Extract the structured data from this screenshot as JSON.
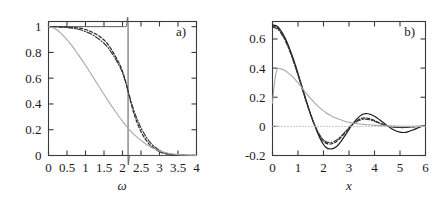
{
  "figure": {
    "background": "#ffffff",
    "foreground": "#1a1a1a",
    "panels": [
      "a)",
      "b)"
    ]
  },
  "chart_data": [
    {
      "type": "line",
      "panel_label": "a)",
      "title": "",
      "xlabel": "ω",
      "ylabel": "",
      "xlim": [
        0,
        4
      ],
      "ylim": [
        0,
        1.04
      ],
      "grid": false,
      "legend": "none",
      "xticks": [
        0,
        0.5,
        1,
        1.5,
        2,
        2.5,
        3,
        3.5,
        4
      ],
      "xticklabels": [
        "0",
        "0.5",
        "1",
        "1.5",
        "2",
        "2.5",
        "3",
        "3.5",
        "4"
      ],
      "yticks": [
        0,
        0.2,
        0.4,
        0.6,
        0.8,
        1
      ],
      "yticklabels": [
        "0",
        "0.2",
        "0.4",
        "0.6",
        "0.8",
        "1"
      ],
      "series": [
        {
          "name": "step-cutoff",
          "style": "solid",
          "color": "#555555",
          "width": 1.0,
          "x": [
            0,
            0.2,
            0.4,
            0.6,
            0.8,
            1.0,
            1.2,
            1.4,
            1.6,
            1.8,
            2.0,
            2.1,
            2.15,
            2.15,
            2.2,
            2.4,
            2.6,
            2.8,
            3.0,
            3.2,
            3.5,
            4.0
          ],
          "y": [
            1,
            1,
            1,
            1,
            1,
            1,
            1,
            1,
            1,
            1,
            1,
            1,
            1,
            0,
            0,
            0,
            0,
            0,
            0,
            0,
            0,
            0
          ]
        },
        {
          "name": "dashed-sigmoid",
          "style": "dashed",
          "color": "#262626",
          "width": 1.2,
          "x": [
            0,
            0.2,
            0.4,
            0.6,
            0.8,
            1.0,
            1.2,
            1.4,
            1.6,
            1.8,
            1.95,
            2.05,
            2.15,
            2.25,
            2.35,
            2.5,
            2.65,
            2.8,
            3.0,
            3.2,
            3.5,
            4.0
          ],
          "y": [
            1.0,
            1.0,
            0.998,
            0.995,
            0.99,
            0.978,
            0.955,
            0.92,
            0.865,
            0.775,
            0.69,
            0.61,
            0.5,
            0.385,
            0.29,
            0.185,
            0.115,
            0.068,
            0.03,
            0.012,
            0.003,
            0.0
          ]
        },
        {
          "name": "dot-dashed-sigmoid",
          "style": "dashdot",
          "color": "#3a3a3a",
          "width": 1.2,
          "x": [
            0,
            0.2,
            0.4,
            0.6,
            0.8,
            1.0,
            1.2,
            1.4,
            1.6,
            1.8,
            1.95,
            2.05,
            2.15,
            2.25,
            2.35,
            2.5,
            2.65,
            2.8,
            3.0,
            3.2,
            3.5,
            4.0
          ],
          "y": [
            1.0,
            0.999,
            0.996,
            0.99,
            0.98,
            0.962,
            0.935,
            0.895,
            0.84,
            0.755,
            0.675,
            0.6,
            0.5,
            0.4,
            0.315,
            0.215,
            0.14,
            0.085,
            0.04,
            0.016,
            0.004,
            0.0
          ]
        },
        {
          "name": "gray-slow-decay",
          "style": "solid",
          "color": "#a8a8a8",
          "width": 1.1,
          "x": [
            0,
            0.2,
            0.4,
            0.6,
            0.8,
            1.0,
            1.2,
            1.4,
            1.6,
            1.8,
            2.0,
            2.2,
            2.4,
            2.6,
            2.8,
            3.0,
            3.2,
            3.5,
            3.75,
            4.0
          ],
          "y": [
            1.0,
            0.98,
            0.93,
            0.865,
            0.785,
            0.7,
            0.61,
            0.52,
            0.43,
            0.345,
            0.265,
            0.195,
            0.14,
            0.095,
            0.06,
            0.035,
            0.02,
            0.007,
            0.003,
            0.0
          ]
        }
      ]
    },
    {
      "type": "line",
      "panel_label": "b)",
      "title": "",
      "xlabel": "x",
      "ylabel": "",
      "xlim": [
        0,
        6
      ],
      "ylim": [
        -0.2,
        0.72
      ],
      "grid": false,
      "legend": "none",
      "xticks": [
        0,
        1,
        2,
        3,
        4,
        5,
        6
      ],
      "xticklabels": [
        "0",
        "1",
        "2",
        "3",
        "4",
        "5",
        "6"
      ],
      "yticks": [
        -0.2,
        0,
        0.2,
        0.4,
        0.6
      ],
      "yticklabels": [
        "-0.2",
        "0",
        "0.2",
        "0.4",
        "0.6"
      ],
      "series": [
        {
          "name": "solid-oscillating",
          "style": "solid",
          "color": "#1a1a1a",
          "width": 1.2,
          "x": [
            0,
            0.15,
            0.3,
            0.5,
            0.7,
            0.9,
            1.1,
            1.3,
            1.5,
            1.7,
            1.9,
            2.1,
            2.3,
            2.5,
            2.7,
            2.9,
            3.1,
            3.3,
            3.5,
            3.65,
            3.8,
            4.0,
            4.2,
            4.4,
            4.6,
            4.8,
            5.0,
            5.15,
            5.3,
            5.5,
            5.7,
            5.85,
            6.0
          ],
          "y": [
            0.695,
            0.69,
            0.665,
            0.605,
            0.52,
            0.42,
            0.305,
            0.19,
            0.08,
            -0.015,
            -0.095,
            -0.145,
            -0.155,
            -0.14,
            -0.1,
            -0.048,
            0.005,
            0.05,
            0.08,
            0.088,
            0.085,
            0.07,
            0.045,
            0.018,
            -0.008,
            -0.028,
            -0.04,
            -0.042,
            -0.038,
            -0.025,
            -0.01,
            0.0,
            0.005
          ]
        },
        {
          "name": "dashed-oscillating",
          "style": "dashed",
          "color": "#262626",
          "width": 1.2,
          "x": [
            0,
            0.15,
            0.3,
            0.5,
            0.7,
            0.9,
            1.1,
            1.3,
            1.5,
            1.7,
            1.9,
            2.1,
            2.3,
            2.5,
            2.7,
            2.9,
            3.1,
            3.3,
            3.5,
            3.65,
            3.8,
            4.0,
            4.2,
            4.5,
            4.8,
            5.1,
            5.4,
            5.7,
            6.0
          ],
          "y": [
            0.685,
            0.68,
            0.655,
            0.595,
            0.51,
            0.41,
            0.3,
            0.185,
            0.08,
            -0.01,
            -0.08,
            -0.115,
            -0.12,
            -0.105,
            -0.072,
            -0.032,
            0.008,
            0.038,
            0.055,
            0.058,
            0.053,
            0.04,
            0.024,
            0.004,
            -0.006,
            -0.008,
            -0.005,
            -0.001,
            0.002
          ]
        },
        {
          "name": "dot-dashed-oscillating",
          "style": "dashdot",
          "color": "#3a3a3a",
          "width": 1.1,
          "x": [
            0,
            0.15,
            0.3,
            0.5,
            0.7,
            0.9,
            1.1,
            1.3,
            1.5,
            1.7,
            1.9,
            2.1,
            2.3,
            2.5,
            2.7,
            2.9,
            3.1,
            3.3,
            3.5,
            3.65,
            3.8,
            4.0,
            4.2,
            4.5,
            4.8,
            5.1,
            5.4,
            5.7,
            6.0
          ],
          "y": [
            0.68,
            0.672,
            0.648,
            0.588,
            0.505,
            0.405,
            0.295,
            0.18,
            0.078,
            -0.008,
            -0.072,
            -0.105,
            -0.11,
            -0.095,
            -0.065,
            -0.028,
            0.006,
            0.032,
            0.046,
            0.05,
            0.046,
            0.034,
            0.02,
            0.003,
            -0.005,
            -0.007,
            -0.004,
            0.0,
            0.002
          ]
        },
        {
          "name": "gray-monotone-decay",
          "style": "solid",
          "color": "#a8a8a8",
          "width": 1.1,
          "x": [
            0,
            0.1,
            0.2,
            0.35,
            0.5,
            0.7,
            0.9,
            1.1,
            1.3,
            1.5,
            1.7,
            1.9,
            2.1,
            2.3,
            2.5,
            2.8,
            3.1,
            3.4,
            3.7,
            4.0,
            4.4,
            4.8,
            5.2,
            5.6,
            6.0
          ],
          "y": [
            0.16,
            0.33,
            0.395,
            0.393,
            0.382,
            0.355,
            0.32,
            0.278,
            0.232,
            0.19,
            0.152,
            0.12,
            0.094,
            0.072,
            0.056,
            0.037,
            0.024,
            0.016,
            0.011,
            0.007,
            0.004,
            0.002,
            0.001,
            0.0,
            0.0
          ]
        },
        {
          "name": "gray-zero-baseline",
          "style": "dotted",
          "color": "#c0c0c0",
          "width": 1.0,
          "x": [
            0,
            1,
            2,
            3,
            4,
            5,
            6
          ],
          "y": [
            0.0,
            0.0,
            0.0,
            0.0,
            0.0,
            0.0,
            0.0
          ]
        }
      ]
    }
  ]
}
